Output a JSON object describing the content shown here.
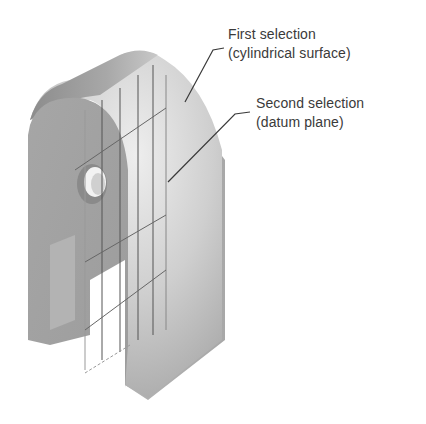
{
  "figure": {
    "colors": {
      "background": "#ffffff",
      "body_dark": "#9a9a9a",
      "body_mid": "#b0b0b0",
      "body_light": "#d8d8d8",
      "leader": "#3a3a3a",
      "text": "#3a3a3a"
    }
  },
  "annotations": [
    {
      "line1": "First selection",
      "line2": "(cylindrical surface)"
    },
    {
      "line1": "Second selection",
      "line2": "(datum plane)"
    }
  ]
}
